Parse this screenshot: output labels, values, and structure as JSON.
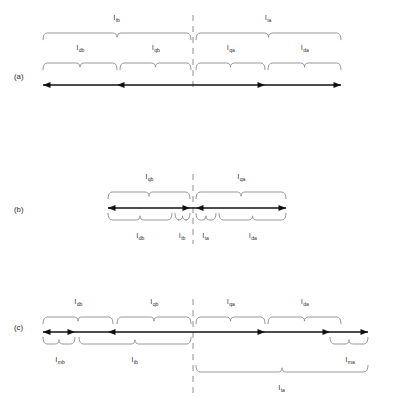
{
  "figure": {
    "title": "",
    "type": "technical-line-diagram",
    "row_tags": [
      "(a)",
      "(b)",
      "(c)"
    ],
    "colors": {
      "axis": "#111111",
      "brace": "#8c8c8c",
      "dashed_reference": "#9a9a9a",
      "label_text": "#2b2b2b",
      "background": "#ffffff"
    },
    "symbol_base": "l"
  },
  "rows": [
    {
      "id": "a",
      "tag": "(a)",
      "brace_tiers": [
        {
          "tier": "top",
          "segments": [
            {
              "label_base": "l",
              "label_sub": "tb",
              "x_start": 43,
              "x_end": 191
            },
            {
              "label_base": "l",
              "label_sub": "ta",
              "x_start": 196,
              "x_end": 341
            }
          ]
        },
        {
          "tier": "middle",
          "segments": [
            {
              "label_base": "l",
              "label_sub": "db",
              "x_start": 43,
              "x_end": 117
            },
            {
              "label_base": "l",
              "label_sub": "qb",
              "x_start": 120,
              "x_end": 191
            },
            {
              "label_base": "l",
              "label_sub": "qa",
              "x_start": 196,
              "x_end": 265
            },
            {
              "label_base": "l",
              "label_sub": "da",
              "x_start": 268,
              "x_end": 341
            }
          ]
        }
      ],
      "axis": {
        "x_start": 43,
        "x_end": 341,
        "arrow_marks": [
          {
            "x": 43,
            "direction": "left"
          },
          {
            "x": 117,
            "direction": "left"
          },
          {
            "x": 265,
            "direction": "right"
          },
          {
            "x": 341,
            "direction": "right"
          }
        ]
      },
      "dashed_line_x": 193
    },
    {
      "id": "b",
      "tag": "(b)",
      "brace_tiers": [
        {
          "tier": "top",
          "segments": [
            {
              "label_base": "l",
              "label_sub": "qb",
              "x_start": 108,
              "x_end": 190
            },
            {
              "label_base": "l",
              "label_sub": "qa",
              "x_start": 196,
              "x_end": 286
            }
          ]
        },
        {
          "tier": "bottom",
          "segments": [
            {
              "label_base": "l",
              "label_sub": "db",
              "x_start": 108,
              "x_end": 172
            },
            {
              "label_base": "l",
              "label_sub": "tb",
              "x_start": 175,
              "x_end": 190
            },
            {
              "label_base": "l",
              "label_sub": "ta",
              "x_start": 196,
              "x_end": 216
            },
            {
              "label_base": "l",
              "label_sub": "da",
              "x_start": 219,
              "x_end": 286
            }
          ]
        }
      ],
      "axis": {
        "x_start": 108,
        "x_end": 286,
        "arrow_marks": [
          {
            "x": 108,
            "direction": "left"
          },
          {
            "x": 190,
            "direction": "right"
          },
          {
            "x": 196,
            "direction": "left"
          },
          {
            "x": 286,
            "direction": "right"
          }
        ]
      },
      "dashed_line_x": 193
    },
    {
      "id": "c",
      "tag": "(c)",
      "brace_tiers": [
        {
          "tier": "top",
          "segments": [
            {
              "label_base": "l",
              "label_sub": "db",
              "x_start": 43,
              "x_end": 113
            },
            {
              "label_base": "l",
              "label_sub": "qb",
              "x_start": 117,
              "x_end": 191
            },
            {
              "label_base": "l",
              "label_sub": "qa",
              "x_start": 196,
              "x_end": 265
            },
            {
              "label_base": "l",
              "label_sub": "da",
              "x_start": 268,
              "x_end": 341
            }
          ]
        },
        {
          "tier": "bottom",
          "segments": [
            {
              "label_base": "l",
              "label_sub": "mb",
              "x_start": 43,
              "x_end": 75
            },
            {
              "label_base": "l",
              "label_sub": "tb",
              "x_start": 79,
              "x_end": 191
            },
            {
              "label_base": "l",
              "label_sub": "ma",
              "x_start": 330,
              "x_end": 368
            }
          ]
        },
        {
          "tier": "bottom-outer",
          "segments": [
            {
              "label_base": "l",
              "label_sub": "ta",
              "x_start": 196,
              "x_end": 368
            }
          ]
        }
      ],
      "axis": {
        "x_start": 43,
        "x_end": 368,
        "arrow_marks": [
          {
            "x": 43,
            "direction": "left"
          },
          {
            "x": 75,
            "direction": "right"
          },
          {
            "x": 108,
            "direction": "left"
          },
          {
            "x": 265,
            "direction": "right"
          },
          {
            "x": 330,
            "direction": "right"
          },
          {
            "x": 368,
            "direction": "right"
          }
        ]
      },
      "dashed_line_x": 193
    }
  ]
}
